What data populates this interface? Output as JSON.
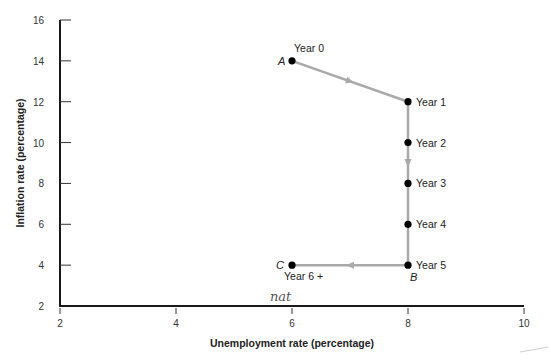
{
  "chart_data": {
    "type": "line",
    "title": "",
    "xlabel": "Unemployment rate (percentage)",
    "ylabel": "Inflation rate (percentage)",
    "xlim": [
      2,
      10
    ],
    "ylim": [
      2,
      16
    ],
    "xticks": [
      2,
      4,
      6,
      8,
      10
    ],
    "yticks": [
      2,
      4,
      6,
      8,
      10,
      12,
      14,
      16
    ],
    "grid": false,
    "series": [
      {
        "name": "Disinflation path",
        "color": "#a9a9a9",
        "points": [
          {
            "x": 6,
            "y": 14,
            "label": "Year 0",
            "letter": "A"
          },
          {
            "x": 8,
            "y": 12,
            "label": "Year 1",
            "letter": ""
          },
          {
            "x": 8,
            "y": 10,
            "label": "Year 2",
            "letter": ""
          },
          {
            "x": 8,
            "y": 8,
            "label": "Year 3",
            "letter": ""
          },
          {
            "x": 8,
            "y": 6,
            "label": "Year 4",
            "letter": ""
          },
          {
            "x": 8,
            "y": 4,
            "label": "Year 5",
            "letter": "B"
          },
          {
            "x": 6,
            "y": 4,
            "label": "Year 6 +",
            "letter": "C"
          }
        ]
      }
    ],
    "annotations": [
      {
        "text": "nat",
        "note": "handwritten near x=6 on the horizontal axis"
      }
    ]
  }
}
